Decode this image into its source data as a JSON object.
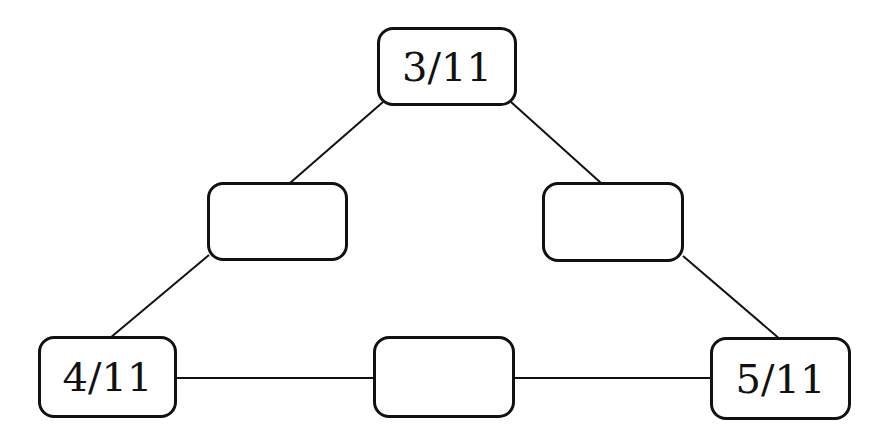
{
  "diagram": {
    "type": "triangle-number-path",
    "nodes": [
      {
        "id": "top",
        "label": "3/11",
        "x": 377,
        "y": 27,
        "w": 140,
        "h": 79
      },
      {
        "id": "mid-left",
        "label": "",
        "x": 207,
        "y": 182,
        "w": 141,
        "h": 79
      },
      {
        "id": "mid-right",
        "label": "",
        "x": 542,
        "y": 182,
        "w": 142,
        "h": 80
      },
      {
        "id": "bottom-left",
        "label": "4/11",
        "x": 38,
        "y": 336,
        "w": 139,
        "h": 82
      },
      {
        "id": "bottom-mid",
        "label": "",
        "x": 373,
        "y": 336,
        "w": 142,
        "h": 82
      },
      {
        "id": "bottom-right",
        "label": "5/11",
        "x": 710,
        "y": 337,
        "w": 141,
        "h": 83
      }
    ],
    "edges": [
      {
        "from": "top",
        "to": "mid-left",
        "x1": 383,
        "y1": 102,
        "x2": 290,
        "y2": 183
      },
      {
        "from": "top",
        "to": "mid-right",
        "x1": 511,
        "y1": 102,
        "x2": 601,
        "y2": 183
      },
      {
        "from": "mid-left",
        "to": "bottom-left",
        "x1": 209,
        "y1": 255,
        "x2": 110,
        "y2": 338
      },
      {
        "from": "mid-right",
        "to": "bottom-right",
        "x1": 683,
        "y1": 256,
        "x2": 781,
        "y2": 340
      },
      {
        "from": "bottom-left",
        "to": "bottom-mid",
        "x1": 176,
        "y1": 378,
        "x2": 374,
        "y2": 378
      },
      {
        "from": "bottom-mid",
        "to": "bottom-right",
        "x1": 514,
        "y1": 378,
        "x2": 711,
        "y2": 378
      }
    ],
    "colors": {
      "stroke": "#111111",
      "fill": "#ffffff",
      "text": "#111111"
    }
  }
}
